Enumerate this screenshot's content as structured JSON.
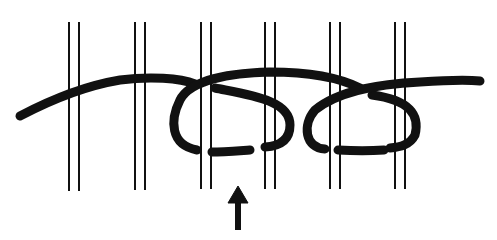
{
  "diagram": {
    "type": "weaving-knot-illustration",
    "background": "#ffffff",
    "ink_color": "#111111",
    "warp_pairs": [
      {
        "x1": 69,
        "x2": 79
      },
      {
        "x1": 135,
        "x2": 145
      },
      {
        "x1": 201,
        "x2": 211
      },
      {
        "x1": 265,
        "x2": 275
      },
      {
        "x1": 330,
        "x2": 340
      },
      {
        "x1": 395,
        "x2": 405
      }
    ],
    "warp_top": 22,
    "warp_bottom": 190,
    "arrow": {
      "x": 238,
      "tip_y": 186,
      "tail_y": 232,
      "direction": "up"
    }
  }
}
